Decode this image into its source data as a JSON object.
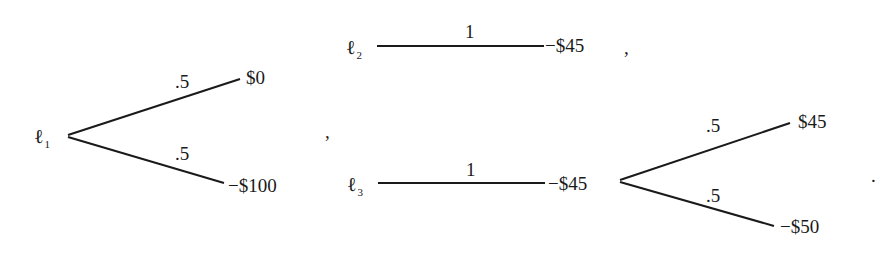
{
  "diagram": {
    "type": "lottery-trees",
    "stroke_color": "#1a1a1a",
    "lotteries": [
      {
        "name": "ℓ",
        "subscript": "1",
        "branches": [
          {
            "prob": ".5",
            "outcome": "$0"
          },
          {
            "prob": ".5",
            "outcome": "−$100"
          }
        ]
      },
      {
        "name": "ℓ",
        "subscript": "2",
        "branches": [
          {
            "prob": "1",
            "outcome": "−$45"
          }
        ]
      },
      {
        "name": "ℓ",
        "subscript": "3",
        "branches": [
          {
            "prob": "1",
            "outcome": "−$45"
          }
        ],
        "sub_branches": [
          {
            "prob": ".5",
            "outcome": "$45"
          },
          {
            "prob": ".5",
            "outcome": "−$50"
          }
        ]
      }
    ],
    "punctuation": {
      "comma_after_l1": ",",
      "comma_after_l2": ",",
      "period_end": "."
    }
  }
}
